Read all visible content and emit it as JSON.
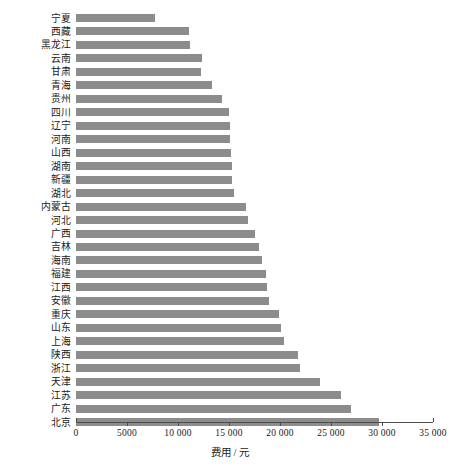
{
  "chart_data": {
    "type": "bar",
    "orientation": "horizontal",
    "title": "",
    "xlabel": "费用 / 元",
    "ylabel": "",
    "xlim": [
      0,
      35000
    ],
    "xticks": [
      0,
      5000,
      10000,
      15000,
      20000,
      25000,
      30000,
      35000
    ],
    "xticklabels": [
      "0",
      "5000",
      "10 000",
      "15 000",
      "20 000",
      "25 000",
      "30 000",
      "35 000"
    ],
    "grid": false,
    "legend": null,
    "bar_color": "#8c8c8c",
    "axis_color": "#4d4d4d",
    "categories": [
      "宁夏",
      "西藏",
      "黑龙江",
      "云南",
      "甘肃",
      "青海",
      "贵州",
      "四川",
      "辽宁",
      "河南",
      "山西",
      "湖南",
      "新疆",
      "湖北",
      "内蒙古",
      "河北",
      "广西",
      "吉林",
      "海南",
      "福建",
      "江西",
      "安徽",
      "重庆",
      "山东",
      "上海",
      "陕西",
      "浙江",
      "天津",
      "江苏",
      "广东",
      "北京"
    ],
    "values": [
      7700,
      11100,
      11200,
      12400,
      12300,
      13300,
      14300,
      15000,
      15100,
      15100,
      15200,
      15300,
      15300,
      15500,
      16700,
      16900,
      17500,
      17900,
      18200,
      18600,
      18700,
      18900,
      19900,
      20100,
      20400,
      21800,
      22000,
      23900,
      26000,
      27000,
      29700
    ]
  }
}
